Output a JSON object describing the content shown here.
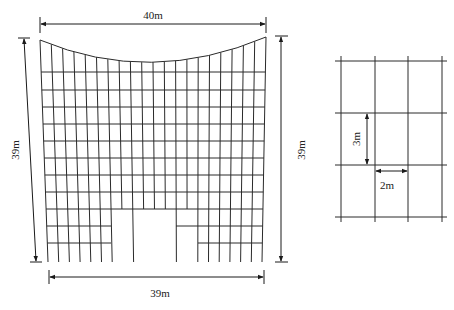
{
  "figure": {
    "main_mesh": {
      "top_dimension": "40m",
      "bottom_dimension": "39m",
      "left_dimension": "39m",
      "right_dimension": "39m",
      "top_edge": "concave-curve",
      "vertical_line_count": 21,
      "full_horizontal_rows": 9,
      "partial_rows_with_openings": 2
    },
    "detail_grid": {
      "vertical_spacing_label": "3m",
      "horizontal_spacing_label": "2m",
      "columns": 3,
      "rows": 3
    },
    "colors": {
      "line": "#2a2a2a",
      "background": "#ffffff"
    }
  }
}
